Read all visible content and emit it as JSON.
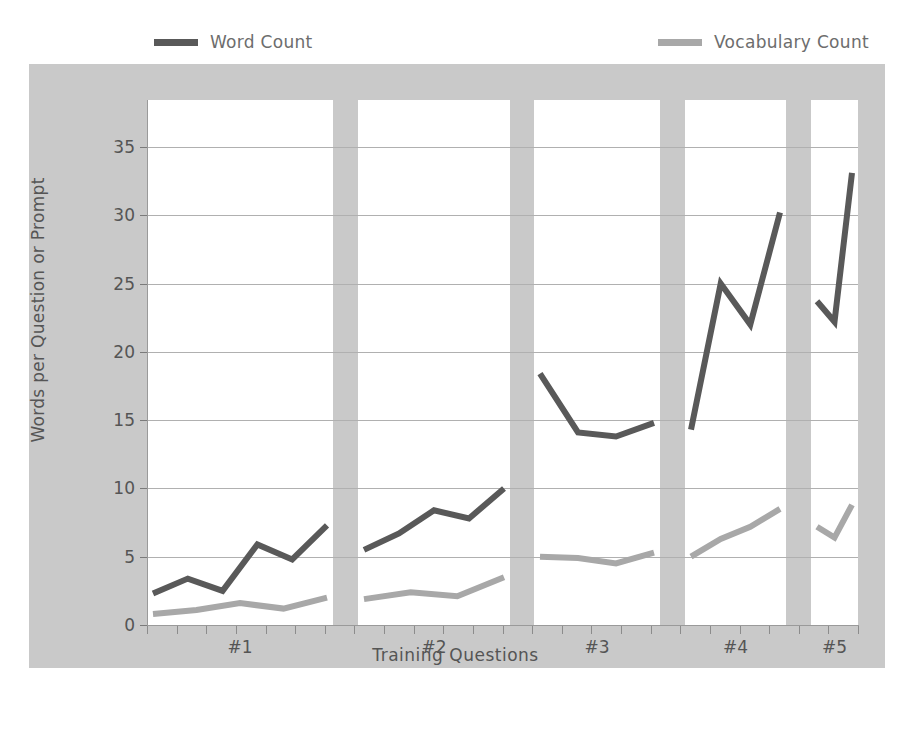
{
  "top_clipped_text": "",
  "legend": {
    "position": "top",
    "items": [
      {
        "label": "Word Count",
        "color": "#595959",
        "icon": "line-swatch-icon"
      },
      {
        "label": "Vocabulary Count",
        "color": "#a8a8a8",
        "icon": "line-swatch-icon"
      }
    ]
  },
  "colors": {
    "word_count": "#595959",
    "vocabulary_count": "#a8a8a8",
    "frame_background": "#c9c9c9",
    "panel_background": "#ffffff",
    "gridline": "#b0b0b0",
    "axis": "#8c8c8c",
    "text": "#555555"
  },
  "chart_data": {
    "type": "line",
    "title": "",
    "subtitle": "",
    "xlabel": "Training Questions",
    "ylabel": "Words per Question or Prompt",
    "ylim": [
      0,
      37
    ],
    "yticks": [
      0,
      5,
      10,
      15,
      20,
      25,
      30,
      35
    ],
    "ytick_labels": [
      "0",
      "5",
      "10",
      "15",
      "20",
      "25",
      "30",
      "35"
    ],
    "grid": true,
    "legend_position": "top",
    "panels": [
      "#1",
      "#2",
      "#3",
      "#4",
      "#5"
    ],
    "xtick_labels": [
      "#1",
      "#2",
      "#3",
      "#4",
      "#5"
    ],
    "x_per_panel": [
      1,
      2,
      3,
      4,
      5,
      6,
      7
    ],
    "series": [
      {
        "name": "Word Count",
        "color": "#595959",
        "panel_values": [
          [
            2.3,
            3.4,
            2.5,
            5.9,
            4.8,
            7.3
          ],
          [
            5.5,
            6.7,
            8.4,
            7.8,
            10.0
          ],
          [
            18.4,
            14.1,
            13.8,
            14.8
          ],
          [
            14.3,
            25.0,
            22.0,
            30.2
          ],
          [
            23.7,
            22.2,
            33.1
          ]
        ]
      },
      {
        "name": "Vocabulary Count",
        "color": "#a8a8a8",
        "panel_values": [
          [
            0.8,
            1.1,
            1.6,
            1.2,
            2.0
          ],
          [
            1.9,
            2.4,
            2.1,
            3.5
          ],
          [
            5.0,
            4.9,
            4.5,
            5.3
          ],
          [
            5.0,
            6.3,
            7.2,
            8.5
          ],
          [
            7.2,
            6.4,
            8.8
          ]
        ]
      }
    ]
  }
}
